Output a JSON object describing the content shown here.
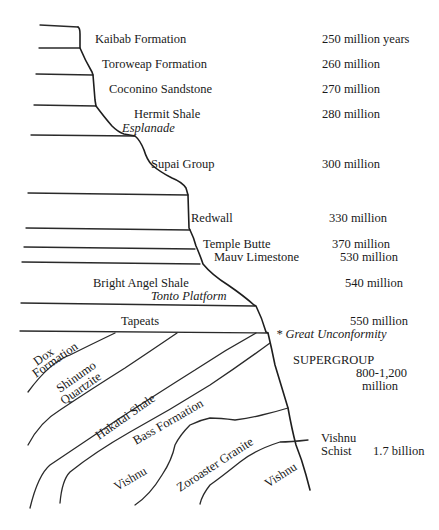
{
  "diagram": {
    "layers": [
      {
        "name": "Kaibab Formation",
        "age": "250 million years"
      },
      {
        "name": "Toroweap Formation",
        "age": "260 million"
      },
      {
        "name": "Coconino Sandstone",
        "age": "270 million"
      },
      {
        "name": "Hermit Shale",
        "age": "280 million"
      },
      {
        "name": "Supai Group",
        "age": "300 million"
      },
      {
        "name": "Redwall",
        "age": "330 million"
      },
      {
        "name": "Temple Butte",
        "age": "370 million"
      },
      {
        "name": "Mauv Limestone",
        "age": "530 million"
      },
      {
        "name": "Bright Angel Shale",
        "age": "540 million"
      },
      {
        "name": "Tapeats",
        "age": "550 million"
      }
    ],
    "features": {
      "esplanade": "Esplanade",
      "tonto_platform": "Tonto Platform",
      "great_unconformity": "* Great Unconformity"
    },
    "supergroup": {
      "label": "SUPERGROUP",
      "age_line1": "800-1,200",
      "age_line2": "million",
      "formations": {
        "dox_line1": "Dox",
        "dox_line2": "Formation",
        "shinumo_line1": "Shinumo",
        "shinumo_line2": "Quartzite",
        "hakatai": "Hakatai Shale",
        "bass": "Bass Formation"
      }
    },
    "basement": {
      "vishnu_left": "Vishnu",
      "zoroaster": "Zoroaster Granite",
      "vishnu_right": "Vishnu",
      "schist_line1": "Vishnu",
      "schist_line2": "Schist",
      "schist_age": "1.7 billion"
    }
  }
}
